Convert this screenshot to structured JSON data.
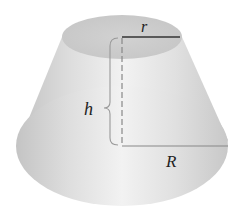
{
  "diagram": {
    "labels": {
      "top_radius": "r",
      "height": "h",
      "bottom_radius": "R"
    },
    "colors": {
      "body_light": "#eeeeee",
      "body_dark": "#bdbdbd",
      "top_face": "#cfcfcf",
      "line": "#444444",
      "dashed": "#888888"
    }
  }
}
